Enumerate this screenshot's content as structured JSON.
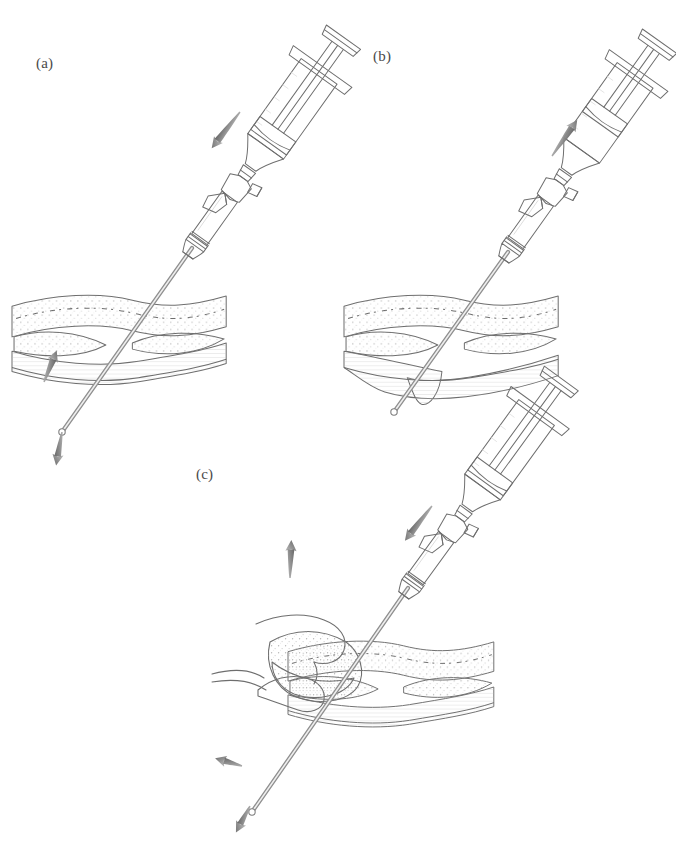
{
  "figure": {
    "kind": "medical-line-illustration",
    "technique": "transfascial needle/trocar insertion with three-way stopcock syringe",
    "background_color": "#ffffff",
    "ink_color": "#6e6e6e",
    "ink_dark_color": "#3f3f3f",
    "arrow_color": "#8a8a8a",
    "arrow_dark_color": "#6b6b6b",
    "tissue_fill": "#f4f4f4",
    "tissue_shadow": "#c9c9c9",
    "tissue_deep": "#8e8e8e",
    "label_color": "#4a4a4a"
  },
  "panels": [
    {
      "id": "a",
      "label": "(a)",
      "label_x": 36,
      "label_y": 55,
      "caption_text": "(a)",
      "instrument": "syringe-with-three-way-stopcock-and-cannula",
      "needle_state": "passed-through-tissue-tip-below",
      "arrows": [
        {
          "name": "plunger-depress-arrow",
          "direction": "down-left",
          "x": 240,
          "y": 112,
          "angle": 128,
          "length": 46
        },
        {
          "name": "tissue-lift-arrow",
          "direction": "up-left",
          "x": 44,
          "y": 382,
          "angle": 292,
          "length": 34
        },
        {
          "name": "needle-withdraw-arrow",
          "direction": "down",
          "x": 62,
          "y": 432,
          "angle": 100,
          "length": 34
        }
      ]
    },
    {
      "id": "b",
      "label": "(b)",
      "label_x": 373,
      "label_y": 48,
      "caption_text": "(b)",
      "instrument": "syringe-with-three-way-stopcock-and-cannula",
      "needle_state": "tip-tenting-tissue-not-perforated",
      "arrows": [
        {
          "name": "plunger-aspirate-arrow",
          "direction": "up-right",
          "x": 552,
          "y": 156,
          "angle": 305,
          "length": 44
        }
      ]
    },
    {
      "id": "c",
      "label": "(c)",
      "label_x": 196,
      "label_y": 466,
      "caption_text": "(c)",
      "instrument": "syringe-with-three-way-stopcock-and-cannula",
      "needle_state": "passed-through-lifted-tissue-flap",
      "hand": "hand-grasping-and-lifting-tissue-flap",
      "arrows": [
        {
          "name": "plunger-depress-arrow",
          "direction": "down-left",
          "x": 432,
          "y": 506,
          "angle": 128,
          "length": 44
        },
        {
          "name": "tissue-lift-arrow",
          "direction": "up",
          "x": 290,
          "y": 578,
          "angle": 272,
          "length": 38
        },
        {
          "name": "needle-retract-arrow",
          "direction": "left",
          "x": 242,
          "y": 766,
          "angle": 196,
          "length": 28
        },
        {
          "name": "needle-withdraw-arrow",
          "direction": "down-left",
          "x": 250,
          "y": 806,
          "angle": 118,
          "length": 30
        }
      ]
    }
  ]
}
